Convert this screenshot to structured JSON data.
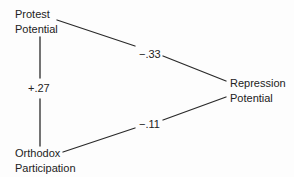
{
  "diagram": {
    "type": "path-diagram",
    "nodes": [
      {
        "id": "protest",
        "lines": [
          "Protest",
          "Potential"
        ]
      },
      {
        "id": "repression",
        "lines": [
          "Repression",
          "Potential"
        ]
      },
      {
        "id": "orthodox",
        "lines": [
          "Orthodox",
          "Participation"
        ]
      }
    ],
    "edges": [
      {
        "from": "protest",
        "to": "repression",
        "coefficient": "−.33"
      },
      {
        "from": "protest",
        "to": "orthodox",
        "coefficient": "+.27"
      },
      {
        "from": "orthodox",
        "to": "repression",
        "coefficient": "−.11"
      }
    ],
    "colors": {
      "ink": "#222222",
      "background": "#fdfdfd"
    }
  }
}
